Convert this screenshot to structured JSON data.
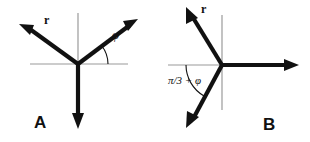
{
  "figure": {
    "title": "",
    "background_color": "#ffffff",
    "vector_color": "#111111",
    "axis_color": "#9a9a9a",
    "width": 310,
    "height": 142
  },
  "panels": [
    {
      "id": "A",
      "letter": "A",
      "letter_x": 34,
      "letter_y": 128,
      "origin": {
        "x": 78,
        "y": 64
      },
      "axes": [
        {
          "name": "horizontal-axis",
          "x1": 30,
          "y1": 64,
          "x2": 128,
          "y2": 64
        },
        {
          "name": "vertical-axis",
          "x1": 78,
          "y1": 13,
          "x2": 78,
          "y2": 64
        }
      ],
      "vectors": [
        {
          "name": "vector-upper-left",
          "label": "r",
          "label_x": 44,
          "label_y": 24,
          "tip_x": 20,
          "tip_y": 25
        },
        {
          "name": "vector-upper-right",
          "label": "",
          "tip_x": 137,
          "tip_y": 20
        },
        {
          "name": "vector-down",
          "label": "",
          "tip_x": 78,
          "tip_y": 128
        }
      ],
      "angle": {
        "name": "angle-phi",
        "label": "φ",
        "label_x": 112,
        "label_y": 39,
        "radius": 30,
        "from_deg": 0,
        "to_deg": 38
      }
    },
    {
      "id": "B",
      "letter": "B",
      "letter_x": 263,
      "letter_y": 130,
      "origin": {
        "x": 222,
        "y": 65
      },
      "axes": [
        {
          "name": "horizontal-axis",
          "x1": 168,
          "y1": 65,
          "x2": 222,
          "y2": 65
        },
        {
          "name": "vertical-axis",
          "x1": 222,
          "y1": 15,
          "x2": 222,
          "y2": 110
        }
      ],
      "vectors": [
        {
          "name": "vector-upper-left",
          "label": "r",
          "label_x": 201,
          "label_y": 13,
          "tip_x": 187,
          "tip_y": 8
        },
        {
          "name": "vector-right",
          "label": "",
          "tip_x": 298,
          "tip_y": 65
        },
        {
          "name": "vector-lower-left",
          "label": "",
          "tip_x": 187,
          "tip_y": 128
        }
      ],
      "angle": {
        "name": "angle-pi-over-3-plus-phi",
        "label": "π/3 + φ",
        "label_x": 168,
        "label_y": 84,
        "radius": 36,
        "from_deg": 180,
        "to_deg": 240
      }
    }
  ]
}
